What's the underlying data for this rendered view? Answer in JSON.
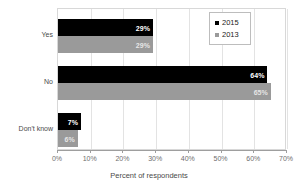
{
  "chart_data": {
    "type": "bar",
    "orientation": "horizontal",
    "title": "",
    "xlabel": "Percent of respondents",
    "ylabel": "",
    "categories": [
      "Yes",
      "No",
      "Don't know"
    ],
    "series": [
      {
        "name": "2015",
        "color": "#000000",
        "values": [
          29,
          64,
          7
        ],
        "labels": [
          "29%",
          "64%",
          "7%"
        ]
      },
      {
        "name": "2013",
        "color": "#9a9a9a",
        "values": [
          29,
          65,
          6
        ],
        "labels": [
          "29%",
          "65%",
          "6%"
        ]
      }
    ],
    "xlim": [
      0,
      70
    ],
    "xticks": [
      0,
      10,
      20,
      30,
      40,
      50,
      60,
      70
    ],
    "xtick_labels": [
      "0%",
      "10%",
      "20%",
      "30%",
      "40%",
      "50%",
      "60%",
      "70%"
    ],
    "grid": true,
    "grid_axis": "x",
    "legend_position": "top-right"
  },
  "legend": {
    "items": [
      {
        "label": "2015",
        "marker": "square-marker-black"
      },
      {
        "label": "2013",
        "marker": "square-marker-gray"
      }
    ]
  },
  "axis": {
    "x_title": "Percent of respondents"
  }
}
